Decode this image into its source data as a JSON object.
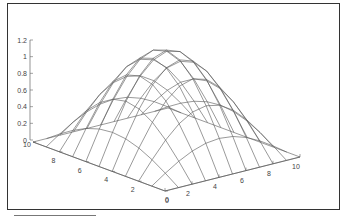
{
  "chart_data": {
    "type": "surface",
    "title": "",
    "x": [
      0,
      1,
      2,
      3,
      4,
      5,
      6,
      7,
      8,
      9,
      10
    ],
    "y": [
      0,
      1,
      2,
      3,
      4,
      5,
      6,
      7,
      8,
      9,
      10
    ],
    "z_function": "sin(pi*x/10)*sin(pi*y/10)",
    "zlim": [
      0,
      1.2
    ],
    "xlim": [
      0,
      10
    ],
    "ylim": [
      0,
      10
    ],
    "z_ticks": [
      "0",
      "0.2",
      "0.4",
      "0.6",
      "0.8",
      "1",
      "1.2"
    ],
    "x_ticks": [
      "0",
      "2",
      "4",
      "6",
      "8",
      "10"
    ],
    "y_ticks": [
      "0",
      "2",
      "4",
      "6",
      "8",
      "10"
    ],
    "xlabel": "",
    "ylabel": "",
    "zlabel": "",
    "grid": false,
    "colors": {
      "mesh": "#555555",
      "axis": "#666666",
      "frame": "#333333"
    }
  }
}
